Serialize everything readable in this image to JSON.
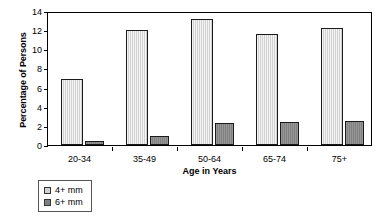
{
  "chart_data": {
    "type": "bar",
    "title": "",
    "subtitle": "",
    "xlabel": "Age in Years",
    "ylabel": "Percentage of Persons",
    "categories": [
      "20-34",
      "35-49",
      "50-64",
      "65-74",
      "75+"
    ],
    "series": [
      {
        "name": "4+ mm",
        "color": "#d2d2d2",
        "values": [
          6.9,
          12.0,
          13.2,
          11.6,
          12.25
        ]
      },
      {
        "name": "6+ mm",
        "color": "#808080",
        "values": [
          0.4,
          0.95,
          2.3,
          2.4,
          2.5
        ]
      }
    ],
    "ylim": [
      0,
      14
    ],
    "yticks": [
      0,
      2,
      4,
      6,
      8,
      10,
      12,
      14
    ],
    "ytick_labels": [
      "0",
      "2",
      "4",
      "6",
      "8",
      "10",
      "12",
      "14"
    ],
    "grid": false,
    "legend_position": "below-left",
    "frame": true,
    "annotations": []
  },
  "legend": {
    "entries": [
      {
        "label": "4+ mm",
        "color": "#d2d2d2"
      },
      {
        "label": "6+ mm",
        "color": "#808080"
      }
    ]
  }
}
